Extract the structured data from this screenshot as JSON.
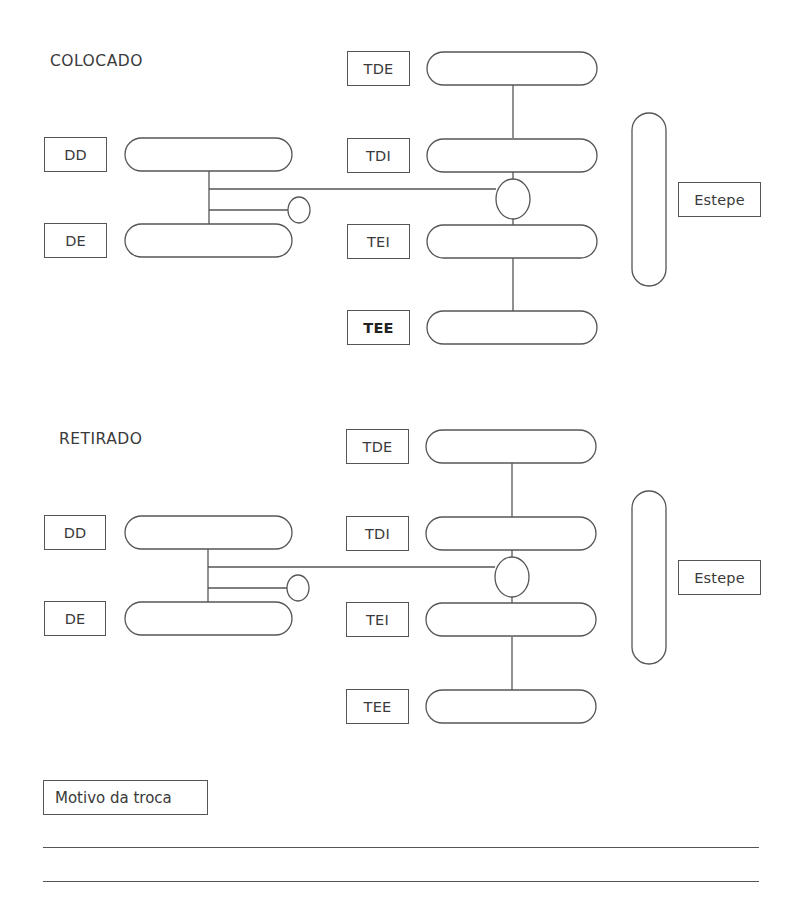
{
  "sections": [
    {
      "id": "colocado",
      "title": "COLOCADO",
      "positions": {
        "dd": "DD",
        "de": "DE",
        "tde": "TDE",
        "tdi": "TDI",
        "tei": "TEI",
        "tee": "TEE",
        "spare": "Estepe"
      }
    },
    {
      "id": "retirado",
      "title": "RETIRADO",
      "positions": {
        "dd": "DD",
        "de": "DE",
        "tde": "TDE",
        "tdi": "TDI",
        "tei": "TEI",
        "tee": "TEE",
        "spare": "Estepe"
      }
    }
  ],
  "reason": {
    "label": "Motivo da troca",
    "lines": [
      "",
      ""
    ]
  },
  "colors": {
    "stroke": "#555555",
    "text": "#3a3a3a",
    "background": "#ffffff"
  }
}
